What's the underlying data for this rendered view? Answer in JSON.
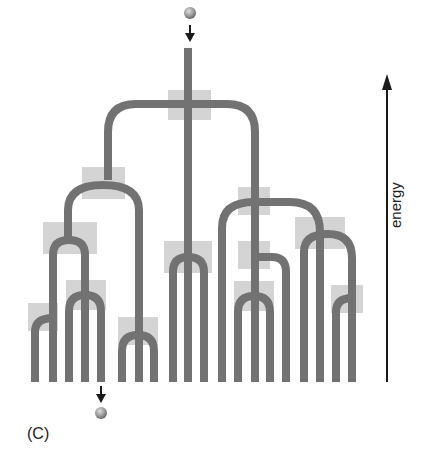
{
  "figure": {
    "panel_label": "(C)",
    "axis_label": "energy",
    "colors": {
      "path": "#727272",
      "node_box": "#d4d4d4",
      "ball": "#9a9a9a",
      "arrow": "#1a1a1a"
    },
    "icons": {
      "input_ball": "sphere",
      "output_ball": "sphere",
      "input_arrow": "arrow-down",
      "output_arrow": "arrow-down",
      "energy_arrow": "arrow-up"
    }
  }
}
